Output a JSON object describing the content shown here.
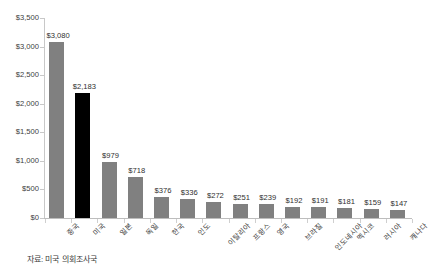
{
  "chart_data": {
    "type": "bar",
    "title": "",
    "subtitle": "",
    "xlabel": "",
    "ylabel": "",
    "ylim": [
      0,
      3500
    ],
    "grid": false,
    "legend": "none",
    "categories": [
      "중국",
      "미국",
      "일본",
      "독일",
      "한국",
      "인도",
      "이탈리아",
      "프랑스",
      "영국",
      "브라질",
      "인도네시아",
      "멕시코",
      "러시아",
      "캐나다"
    ],
    "values": [
      3080,
      2183,
      979,
      718,
      376,
      336,
      272,
      251,
      239,
      192,
      191,
      181,
      159,
      147
    ],
    "value_labels": [
      "$3,080",
      "$2,183",
      "$979",
      "$718",
      "$376",
      "$336",
      "$272",
      "$251",
      "$239",
      "$192",
      "$191",
      "$181",
      "$159",
      "$147"
    ],
    "bar_colors": [
      "#808080",
      "#000000",
      "#808080",
      "#808080",
      "#808080",
      "#808080",
      "#808080",
      "#808080",
      "#808080",
      "#808080",
      "#808080",
      "#808080",
      "#808080",
      "#808080"
    ],
    "highlight_index": 1,
    "y_ticks": [
      0,
      500,
      1000,
      1500,
      2000,
      2500,
      3000,
      3500
    ],
    "y_tick_labels": [
      "$0",
      "$500",
      "$1,000",
      "$1,500",
      "$2,000",
      "$2,500",
      "$3,000",
      "$3,500"
    ],
    "series": [
      {
        "name": "",
        "values": [
          3080,
          2183,
          979,
          718,
          376,
          336,
          272,
          251,
          239,
          192,
          191,
          181,
          159,
          147
        ]
      }
    ]
  },
  "footer": {
    "source": "자료: 미국 의회조사국"
  }
}
